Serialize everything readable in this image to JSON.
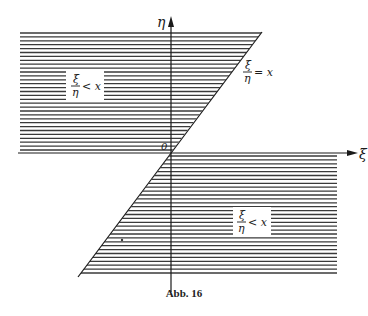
{
  "figure": {
    "caption": "Abb. 16",
    "axes": {
      "horizontal_label": "ξ",
      "vertical_label": "η",
      "origin_label": "0"
    },
    "boundary_line": {
      "label_num": "ξ",
      "label_den": "η",
      "label_rel": "= x"
    },
    "regions": [
      {
        "id": "upper-left",
        "label_num": "ξ",
        "label_den": "η",
        "label_rel": "< x"
      },
      {
        "id": "lower-right",
        "label_num": "ξ",
        "label_den": "η",
        "label_rel": "< x"
      }
    ],
    "colors": {
      "ink": "#1a1a1a",
      "hatch": "#3a3a3a",
      "background": "#ffffff"
    }
  }
}
